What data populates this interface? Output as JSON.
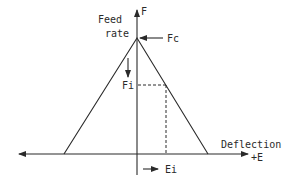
{
  "diagram": {
    "type": "feed-rate vs deflection triangular profile",
    "y_axis": {
      "label_line1": "Feed",
      "label_line2": "rate",
      "symbol": "F"
    },
    "x_axis": {
      "label": "Deflection",
      "symbol": "+E"
    },
    "annotations": {
      "peak": "Fc",
      "intermediate_feed": "Fi",
      "intermediate_deflection": "Ei"
    },
    "colors": {
      "line": "#2a2a2a",
      "background": "#ffffff"
    }
  }
}
